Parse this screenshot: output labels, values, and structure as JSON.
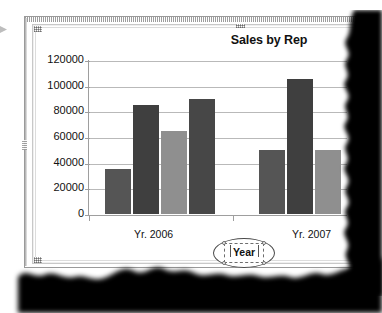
{
  "document": {
    "type": "scanned-page",
    "object_selected": true
  },
  "chart_data": {
    "type": "bar",
    "title": "Sales by Rep",
    "xlabel": "",
    "ylabel": "",
    "categories": [
      "Yr. 2006",
      "Yr. 2007"
    ],
    "series": [
      {
        "name": "Rep 1",
        "values": [
          35000,
          50000
        ],
        "color": "#555555"
      },
      {
        "name": "Rep 2",
        "values": [
          85000,
          105000
        ],
        "color": "#3f3f3f"
      },
      {
        "name": "Rep 3",
        "values": [
          65000,
          50000
        ],
        "color": "#8f8f8f"
      },
      {
        "name": "Rep 4",
        "values": [
          90000,
          null
        ],
        "color": "#474747"
      }
    ],
    "ylim": [
      0,
      120000
    ],
    "yticks": [
      "0",
      "20000",
      "40000",
      "60000",
      "80000",
      "100000",
      "120000"
    ],
    "ytick_values": [
      0,
      20000,
      40000,
      60000,
      80000,
      100000,
      120000
    ],
    "grid": true,
    "legend": "none",
    "note": "Right portion of second category group is cut off by torn page edge"
  },
  "annotation": {
    "callout_label": "Year",
    "shape": "ellipse",
    "selected": true
  },
  "colors": {
    "grid": "#b9b9b9",
    "axis": "#9e9e9e",
    "text": "#111111",
    "frame": "#c8c8c8",
    "paper": "#ffffff"
  },
  "icons": {
    "selection_handle": "selection-handle-icon",
    "page_edge": "page-edge-marker-icon"
  }
}
